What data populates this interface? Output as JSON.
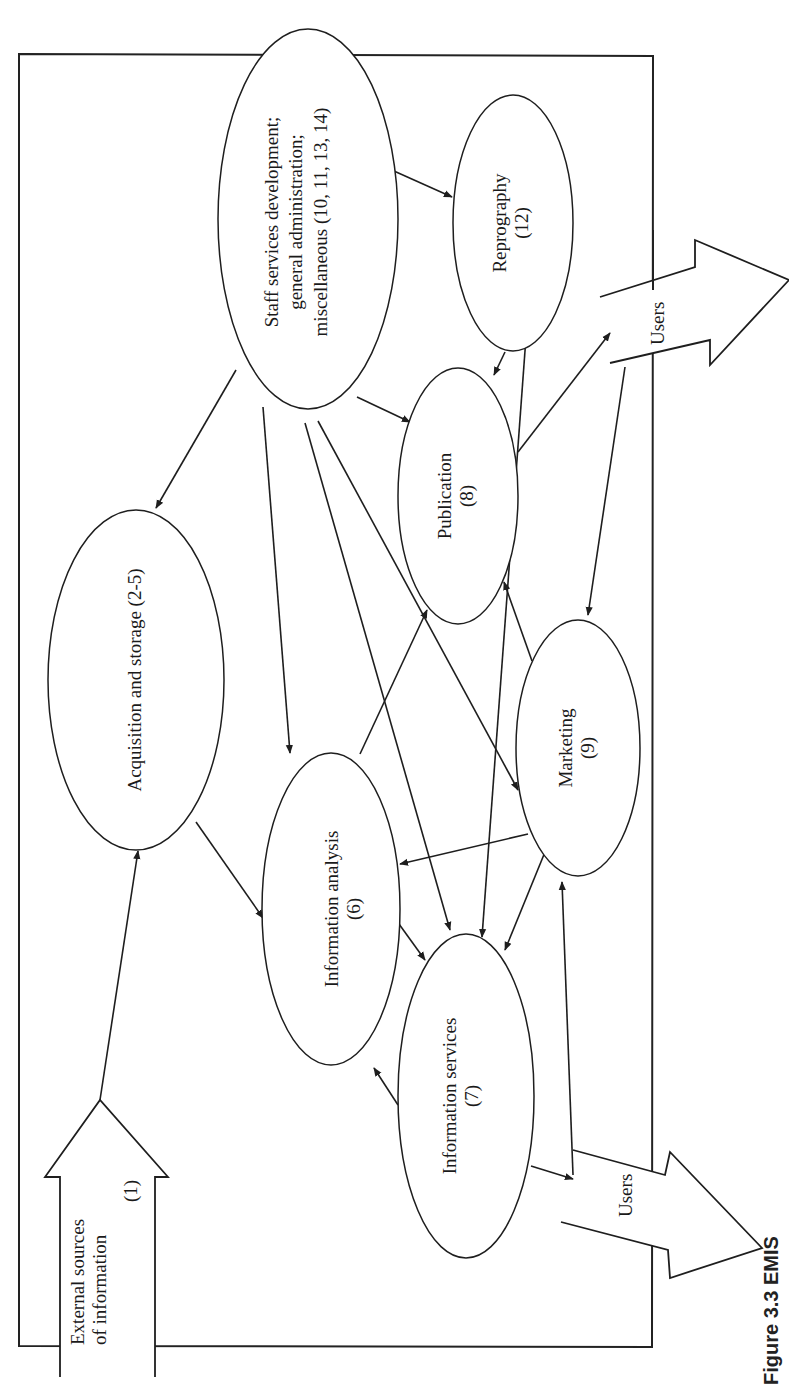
{
  "figure": {
    "caption": "Figure 3.3 EMIS",
    "orientation": "rotated-90-ccw",
    "frame": {
      "x": 19,
      "y": 54,
      "width": 634,
      "height": 1293
    }
  },
  "nodes": [
    {
      "id": "external",
      "label_lines": [
        "External sources",
        "of information"
      ],
      "number": "(1)",
      "shape": "block-arrow-up"
    },
    {
      "id": "acquisition",
      "label_lines": [
        "Acquisition and storage (2-5)"
      ],
      "number": "",
      "shape": "ellipse"
    },
    {
      "id": "analysis",
      "label_lines": [
        "Information analysis"
      ],
      "number": "(6)",
      "shape": "ellipse"
    },
    {
      "id": "services",
      "label_lines": [
        "Information services"
      ],
      "number": "(7)",
      "shape": "ellipse"
    },
    {
      "id": "publication",
      "label_lines": [
        "Publication"
      ],
      "number": "(8)",
      "shape": "ellipse"
    },
    {
      "id": "marketing",
      "label_lines": [
        "Marketing"
      ],
      "number": "(9)",
      "shape": "ellipse"
    },
    {
      "id": "staff",
      "label_lines": [
        "Staff services development;",
        "general administration;",
        "miscellaneous (10, 11, 13, 14)"
      ],
      "number": "",
      "shape": "ellipse"
    },
    {
      "id": "reprography",
      "label_lines": [
        "Reprography"
      ],
      "number": "(12)",
      "shape": "ellipse"
    }
  ],
  "outputs": [
    {
      "id": "users-top",
      "label": "Users",
      "shape": "block-arrow-right"
    },
    {
      "id": "users-bottom",
      "label": "Users",
      "shape": "block-arrow-right"
    }
  ],
  "edges": [
    {
      "from": "external",
      "to": "acquisition"
    },
    {
      "from": "staff",
      "to": "acquisition"
    },
    {
      "from": "staff",
      "to": "reprography"
    },
    {
      "from": "staff",
      "to": "publication"
    },
    {
      "from": "staff",
      "to": "analysis"
    },
    {
      "from": "staff",
      "to": "services"
    },
    {
      "from": "staff",
      "to": "marketing"
    },
    {
      "from": "acquisition",
      "to": "analysis"
    },
    {
      "from": "analysis",
      "to": "publication"
    },
    {
      "from": "analysis",
      "to": "services"
    },
    {
      "from": "services",
      "to": "analysis"
    },
    {
      "from": "reprography",
      "to": "publication"
    },
    {
      "from": "reprography",
      "to": "services"
    },
    {
      "from": "publication",
      "to": "users-top"
    },
    {
      "from": "marketing",
      "to": "publication"
    },
    {
      "from": "marketing",
      "to": "analysis"
    },
    {
      "from": "marketing",
      "to": "services"
    },
    {
      "from": "users-top",
      "to": "marketing"
    },
    {
      "from": "users-bottom",
      "to": "marketing"
    },
    {
      "from": "services",
      "to": "users-bottom"
    }
  ]
}
